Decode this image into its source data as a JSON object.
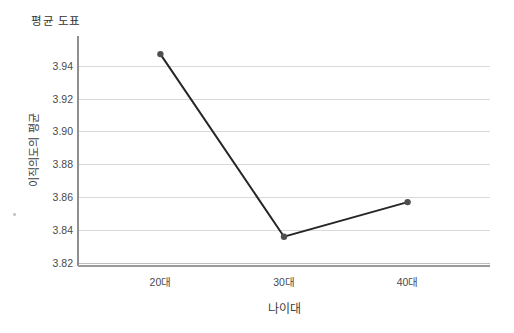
{
  "chart": {
    "title": "평균 도표",
    "y_axis_title": "이직의도의 평균",
    "x_axis_title": "나이대"
  },
  "chart_data": {
    "type": "line",
    "title": "평균 도표",
    "xlabel": "나이대",
    "ylabel": "이직의도의 평균",
    "categories": [
      "20대",
      "30대",
      "40대"
    ],
    "values": [
      3.947,
      3.836,
      3.857
    ],
    "ylim": [
      3.82,
      3.958
    ],
    "yticks": [
      3.82,
      3.84,
      3.86,
      3.88,
      3.9,
      3.92,
      3.94
    ],
    "grid": true,
    "legend": "none",
    "colors": {
      "line": "#262626",
      "marker": "#4f4f4f",
      "grid": "#d9d9d9",
      "axis": "#8f8f8f",
      "bottom_rule": "#9a9a9a",
      "text": "#4a4a4a"
    },
    "x_fractions": [
      0.2,
      0.5,
      0.8
    ]
  }
}
